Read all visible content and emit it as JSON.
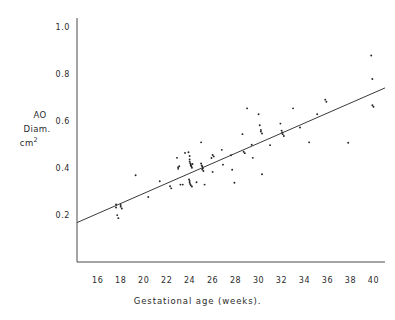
{
  "chart_data": {
    "type": "scatter",
    "title": "",
    "xlabel": "Gestational age (weeks).",
    "ylabel_lines": [
      "AO",
      "Diam.",
      "cm"
    ],
    "ylabel_superscript": "2",
    "xlim": [
      14.2,
      41.0
    ],
    "ylim": [
      0.0,
      1.04
    ],
    "xticks": [
      16,
      18,
      20,
      22,
      24,
      26,
      28,
      30,
      32,
      34,
      36,
      38,
      40
    ],
    "yticks": [
      0.2,
      0.4,
      0.6,
      0.8,
      1.0
    ],
    "xtick_labels": [
      "16",
      "18",
      "20",
      "22",
      "24",
      "26",
      "28",
      "30",
      "32",
      "34",
      "36",
      "38",
      "40"
    ],
    "ytick_labels": [
      "0.2",
      "0.4",
      "0.6",
      "0.8",
      "1.0"
    ],
    "grid": false,
    "legend": "none",
    "marker_color": "#242424",
    "line_color": "#3a3a3a",
    "axis_color": "#4a4a4a",
    "background": "#ffffff",
    "series": [
      {
        "name": "AO diameter measurements",
        "marker": "dot",
        "points": [
          [
            17.6,
            0.245
          ],
          [
            17.6,
            0.232
          ],
          [
            17.7,
            0.2
          ],
          [
            17.8,
            0.187
          ],
          [
            18.0,
            0.243
          ],
          [
            18.0,
            0.236
          ],
          [
            18.1,
            0.228
          ],
          [
            19.3,
            0.37
          ],
          [
            20.4,
            0.277
          ],
          [
            21.4,
            0.344
          ],
          [
            22.3,
            0.323
          ],
          [
            22.4,
            0.314
          ],
          [
            22.9,
            0.444
          ],
          [
            23.0,
            0.404
          ],
          [
            23.0,
            0.397
          ],
          [
            23.1,
            0.408
          ],
          [
            23.2,
            0.33
          ],
          [
            23.4,
            0.33
          ],
          [
            23.6,
            0.465
          ],
          [
            23.9,
            0.468
          ],
          [
            24.0,
            0.452
          ],
          [
            24.0,
            0.437
          ],
          [
            24.0,
            0.428
          ],
          [
            24.05,
            0.421
          ],
          [
            24.1,
            0.417
          ],
          [
            24.1,
            0.411
          ],
          [
            24.15,
            0.408
          ],
          [
            24.2,
            0.402
          ],
          [
            24.25,
            0.418
          ],
          [
            23.95,
            0.352
          ],
          [
            24.0,
            0.345
          ],
          [
            24.0,
            0.338
          ],
          [
            24.05,
            0.332
          ],
          [
            24.1,
            0.327
          ],
          [
            24.2,
            0.322
          ],
          [
            24.6,
            0.34
          ],
          [
            25.0,
            0.51
          ],
          [
            25.0,
            0.42
          ],
          [
            25.05,
            0.412
          ],
          [
            25.1,
            0.407
          ],
          [
            25.15,
            0.4
          ],
          [
            25.1,
            0.394
          ],
          [
            25.2,
            0.388
          ],
          [
            25.3,
            0.33
          ],
          [
            25.9,
            0.443
          ],
          [
            26.0,
            0.456
          ],
          [
            26.1,
            0.45
          ],
          [
            26.0,
            0.384
          ],
          [
            26.8,
            0.478
          ],
          [
            26.9,
            0.415
          ],
          [
            27.6,
            0.455
          ],
          [
            27.7,
            0.393
          ],
          [
            27.9,
            0.338
          ],
          [
            28.6,
            0.545
          ],
          [
            28.7,
            0.47
          ],
          [
            28.8,
            0.464
          ],
          [
            29.0,
            0.655
          ],
          [
            29.4,
            0.5
          ],
          [
            29.5,
            0.444
          ],
          [
            30.0,
            0.63
          ],
          [
            30.1,
            0.583
          ],
          [
            30.2,
            0.563
          ],
          [
            30.2,
            0.556
          ],
          [
            30.3,
            0.548
          ],
          [
            30.3,
            0.374
          ],
          [
            31.0,
            0.498
          ],
          [
            31.9,
            0.59
          ],
          [
            32.0,
            0.56
          ],
          [
            32.05,
            0.552
          ],
          [
            32.1,
            0.545
          ],
          [
            32.2,
            0.537
          ],
          [
            33.0,
            0.655
          ],
          [
            33.6,
            0.573
          ],
          [
            34.4,
            0.51
          ],
          [
            35.1,
            0.63
          ],
          [
            35.8,
            0.692
          ],
          [
            35.9,
            0.683
          ],
          [
            37.8,
            0.508
          ],
          [
            39.8,
            0.88
          ],
          [
            39.9,
            0.78
          ],
          [
            39.9,
            0.668
          ],
          [
            40.0,
            0.662
          ]
        ]
      }
    ],
    "regression_line": {
      "name": "fitted regression line",
      "x_start": 14.2,
      "y_start": 0.168,
      "x_end": 41.0,
      "y_end": 0.742
    }
  }
}
